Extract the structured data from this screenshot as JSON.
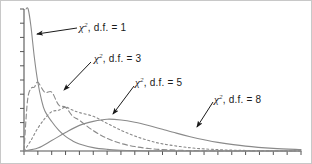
{
  "figure": {
    "title": "",
    "background_color": "#ffffff",
    "border_color": "#c8c8c8",
    "width": 312,
    "height": 164
  },
  "annotations": [
    {
      "id": "df1",
      "symbol": "χ",
      "superscript": "2",
      "text": ", d.f. = 1",
      "full_text": "χ², d.f. = 1",
      "arrow_from": [
        76,
        27
      ],
      "arrow_to": [
        36,
        33
      ]
    },
    {
      "id": "df3",
      "symbol": "χ",
      "superscript": "2",
      "text": ", d.f. = 3",
      "full_text": "χ², d.f. = 3",
      "arrow_from": [
        90,
        61
      ],
      "arrow_to": [
        63,
        89
      ]
    },
    {
      "id": "df5",
      "symbol": "χ",
      "superscript": "2",
      "text": ", d.f. = 5",
      "full_text": "χ², d.f. = 5",
      "arrow_from": [
        133,
        85
      ],
      "arrow_to": [
        112,
        113
      ]
    },
    {
      "id": "df8",
      "symbol": "χ",
      "superscript": "2",
      "text": ", d.f. = 8",
      "full_text": "χ², d.f. = 8",
      "arrow_from": [
        212,
        101
      ],
      "arrow_to": [
        196,
        126
      ]
    }
  ],
  "chart_data": {
    "type": "line",
    "xlabel": "",
    "ylabel": "",
    "xlim": [
      0,
      20
    ],
    "ylim": [
      0,
      0.5
    ],
    "grid": false,
    "legend": "annotations-with-arrows",
    "x_tick_labels": [],
    "y_tick_labels": [],
    "x_tick_count": 21,
    "y_tick_count": 11,
    "axis_color": "#555555",
    "series": [
      {
        "name": "χ², d.f. = 1",
        "df": 1,
        "line_style": "solid",
        "color": "#8a8a8a",
        "peak_x": 0,
        "x": [
          0.15,
          0.3,
          0.5,
          0.75,
          1.0,
          1.25,
          1.5,
          2.0,
          2.5,
          3.0,
          3.5,
          4.0,
          5.0,
          6.0,
          7.0,
          8.0,
          9.0,
          10.0,
          12.0,
          14.0,
          16.0,
          18.0,
          20.0
        ],
        "y": [
          0.8626,
          0.5791,
          0.4394,
          0.3284,
          0.242,
          0.1826,
          0.142,
          0.1037,
          0.0734,
          0.0514,
          0.0358,
          0.0249,
          0.012,
          0.0058,
          0.0028,
          0.0013,
          0.0006,
          0.0003,
          0.0001,
          0.0,
          0.0,
          0.0,
          0.0
        ]
      },
      {
        "name": "χ², d.f. = 3",
        "df": 3,
        "line_style": "dashed",
        "color": "#8a8a8a",
        "peak_x": 1,
        "x": [
          0.0,
          0.25,
          0.5,
          0.75,
          1.0,
          1.5,
          2.0,
          2.5,
          3.0,
          3.5,
          4.0,
          5.0,
          6.0,
          7.0,
          8.0,
          9.0,
          10.0,
          12.0,
          14.0,
          16.0,
          18.0,
          20.0
        ],
        "y": [
          0.0,
          0.176,
          0.2197,
          0.225,
          0.242,
          0.2067,
          0.2076,
          0.162,
          0.1542,
          0.1233,
          0.108,
          0.0716,
          0.0446,
          0.0267,
          0.0156,
          0.0089,
          0.005,
          0.0015,
          0.0005,
          0.0001,
          0.0,
          0.0
        ]
      },
      {
        "name": "χ², d.f. = 5",
        "df": 5,
        "line_style": "dotted",
        "color": "#8a8a8a",
        "peak_x": 3,
        "x": [
          0.0,
          0.5,
          1.0,
          1.5,
          2.0,
          2.5,
          3.0,
          3.5,
          4.0,
          5.0,
          6.0,
          7.0,
          8.0,
          9.0,
          10.0,
          12.0,
          14.0,
          16.0,
          18.0,
          20.0
        ],
        "y": [
          0.0,
          0.0374,
          0.0807,
          0.1139,
          0.1383,
          0.1436,
          0.1542,
          0.1441,
          0.1353,
          0.122,
          0.0973,
          0.073,
          0.0527,
          0.0369,
          0.0252,
          0.0113,
          0.0048,
          0.0019,
          0.0007,
          0.0003
        ]
      },
      {
        "name": "χ², d.f. = 8",
        "df": 8,
        "line_style": "solid",
        "color": "#8a8a8a",
        "peak_x": 6,
        "x": [
          0.0,
          1.0,
          2.0,
          3.0,
          4.0,
          5.0,
          6.0,
          7.0,
          8.0,
          9.0,
          10.0,
          11.0,
          12.0,
          13.0,
          14.0,
          16.0,
          18.0,
          20.0
        ],
        "y": [
          0.0,
          0.0102,
          0.0368,
          0.0652,
          0.0902,
          0.1042,
          0.112,
          0.1094,
          0.1014,
          0.09,
          0.0764,
          0.0629,
          0.0505,
          0.0395,
          0.0304,
          0.0172,
          0.0092,
          0.0048
        ]
      }
    ]
  }
}
